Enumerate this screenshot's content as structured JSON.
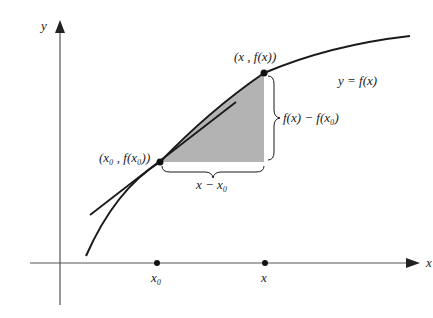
{
  "diagram": {
    "axes": {
      "x_label": "x",
      "y_label": "y"
    },
    "curve_label": "y = f(x)",
    "points": [
      {
        "id": "p0",
        "label": "(x₀ , f(x₀))",
        "axis_label": "x₀"
      },
      {
        "id": "p1",
        "label": "(x , f(x))",
        "axis_label": "x"
      }
    ],
    "brace_horizontal_label": "x − x₀",
    "brace_vertical_label": "f(x) − f(x₀)",
    "colors": {
      "line": "#1a1a1a",
      "shade": "#b3b3b3",
      "axis": "#555555"
    }
  }
}
